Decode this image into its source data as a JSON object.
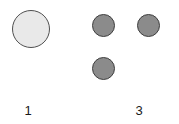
{
  "figure": {
    "background_color": "#ffffff",
    "width": 179,
    "height": 124
  },
  "chart_data": {
    "type": "scatter",
    "title": "",
    "subtitle": "",
    "xlabel": "",
    "ylabel": "",
    "grid": false,
    "legend_position": "none",
    "xlim": [
      0,
      4
    ],
    "ylim": [
      0,
      3
    ],
    "x_tick_labels": [
      "1",
      "3"
    ],
    "x_tick_positions": [
      1,
      3
    ],
    "y_tick_labels": [],
    "marker_shape": "circle",
    "series": [
      {
        "name": "large-light-node",
        "fill_color": "#e9e9e9",
        "edge_color": "#4f4f4f",
        "points": [
          {
            "label": "node-1",
            "x": 1,
            "y": 2,
            "size_px": 38,
            "cx": 31,
            "cy": 29
          }
        ]
      },
      {
        "name": "medium-dark-nodes",
        "fill_color": "#8b8b8b",
        "edge_color": "#3f3f3f",
        "points": [
          {
            "label": "node-2",
            "x": 2.3,
            "y": 2,
            "size_px": 23,
            "cx": 103,
            "cy": 25
          },
          {
            "label": "node-3",
            "x": 3.3,
            "y": 2,
            "size_px": 23,
            "cx": 148,
            "cy": 25
          },
          {
            "label": "node-4",
            "x": 2.3,
            "y": 1,
            "size_px": 23,
            "cx": 103,
            "cy": 68
          }
        ]
      }
    ],
    "annotations": []
  },
  "axis": {
    "labels": [
      {
        "name": "x-tick-label-1",
        "text": "1",
        "center_x": 28,
        "top": 103
      },
      {
        "name": "x-tick-label-3",
        "text": "3",
        "center_x": 139,
        "top": 103
      }
    ]
  }
}
